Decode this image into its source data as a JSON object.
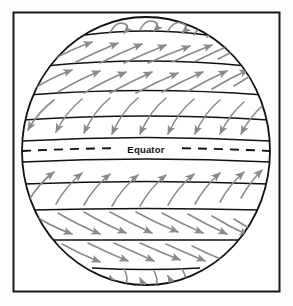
{
  "figure": {
    "name": "global-wind-belts-diagram",
    "type": "diagram",
    "background_color": "#fdfdfd",
    "frame": {
      "name": "diagram-border",
      "stroke_color": "#1a1a1a",
      "stroke_width": 2,
      "x": 13,
      "y": 12,
      "width": 267,
      "height": 280
    },
    "globe": {
      "name": "earth-sphere",
      "center_x": 146,
      "center_y": 151,
      "radius_x": 124,
      "radius_y": 134,
      "outline_color": "#111111",
      "outline_width": 1.8,
      "fill_color": "#ffffff"
    },
    "equator": {
      "label": "Equator",
      "line_style": "dashed",
      "line_color": "#111111",
      "dash_pattern": "9 7",
      "y": 151,
      "label_x": 146,
      "label_y": 154
    },
    "latitude_lines": {
      "name": "latitude-band-lines",
      "stroke_color": "#111111",
      "stroke_width": 1.7,
      "count": 10,
      "y_values": [
        33,
        63,
        93,
        118,
        140,
        162,
        184,
        209,
        239,
        269
      ]
    },
    "arrows": {
      "name": "wind-direction-arrows",
      "stroke_color": "#8a8a8a",
      "stroke_width": 1.6,
      "head_color": "#8a8a8a",
      "description": "Curved arrows showing surface winds deflected by the Coriolis effect"
    },
    "wind_belts": [
      {
        "name": "north-polar-easterlies",
        "hemisphere": "north",
        "band_top": 18,
        "band_bottom": 33,
        "direction": "curling westward over the pole",
        "arrow_count": 4
      },
      {
        "name": "north-polar-easterlies-band",
        "hemisphere": "north",
        "band_top": 33,
        "band_bottom": 63,
        "direction": "northeastward",
        "arrow_count": 9
      },
      {
        "name": "northern-westerlies",
        "hemisphere": "north",
        "band_top": 63,
        "band_bottom": 93,
        "direction": "northeastward",
        "arrow_count": 9
      },
      {
        "name": "northeast-trade-winds",
        "hemisphere": "north",
        "band_top": 93,
        "band_bottom": 140,
        "direction": "southwestward",
        "arrow_count": 9
      },
      {
        "name": "southeast-trade-winds",
        "hemisphere": "south",
        "band_top": 162,
        "band_bottom": 209,
        "direction": "northwestward",
        "arrow_count": 9
      },
      {
        "name": "southern-westerlies",
        "hemisphere": "south",
        "band_top": 209,
        "band_bottom": 239,
        "direction": "southeastward",
        "arrow_count": 9
      },
      {
        "name": "south-polar-easterlies-band",
        "hemisphere": "south",
        "band_top": 239,
        "band_bottom": 269,
        "direction": "southeastward",
        "arrow_count": 6
      },
      {
        "name": "south-polar-easterlies",
        "hemisphere": "south",
        "band_top": 269,
        "band_bottom": 285,
        "direction": "curling westward over the pole",
        "arrow_count": 3
      }
    ]
  }
}
